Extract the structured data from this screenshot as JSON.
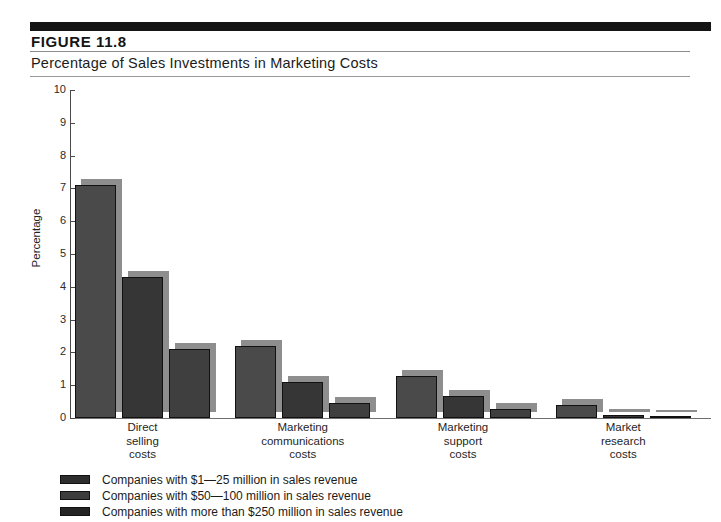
{
  "figure": {
    "number_label": "FIGURE  11.8",
    "caption": "Percentage of Sales Investments in Marketing Costs"
  },
  "chart_data": {
    "type": "bar",
    "title": "Percentage of Sales Investments in Marketing Costs",
    "xlabel": "",
    "ylabel": "Percentage",
    "ylim": [
      0,
      10
    ],
    "ytick_labels": [
      "10",
      "9",
      "8",
      "7",
      "6",
      "5",
      "4",
      "3",
      "2",
      "1",
      "0"
    ],
    "yticks": [
      10,
      9,
      8,
      7,
      6,
      5,
      4,
      3,
      2,
      1,
      0
    ],
    "grid": false,
    "legend_position": "below-plot-left",
    "categories": [
      "Direct selling costs",
      "Marketing communications costs",
      "Marketing support costs",
      "Market research costs"
    ],
    "category_label_lines": [
      [
        "Direct",
        "selling",
        "costs"
      ],
      [
        "Marketing",
        "communications",
        "costs"
      ],
      [
        "Marketing",
        "support",
        "costs"
      ],
      [
        "Market",
        "research",
        "costs"
      ]
    ],
    "series": [
      {
        "name": "Companies with $1—25 million in sales revenue",
        "values": [
          7.1,
          2.2,
          1.27,
          0.4
        ],
        "color": "#4a4a4a"
      },
      {
        "name": "Companies with $50—100 million in sales revenue",
        "values": [
          4.3,
          1.1,
          0.67,
          0.1
        ],
        "color": "#363636"
      },
      {
        "name": "Companies with more than $250 million in sales revenue",
        "values": [
          2.1,
          0.45,
          0.28,
          0.05
        ],
        "color": "#3f3f3f"
      }
    ]
  },
  "legend": {
    "entries": [
      "Companies with $1—25 million in sales revenue",
      "Companies with $50—100 million in sales revenue",
      "Companies with more than $250 million in sales revenue"
    ]
  },
  "colors": {
    "band": "#141414",
    "bar_face": "#3b3b3b",
    "bar_shadow": "#8e8e8e",
    "rule": "#8d8d8d",
    "text": "#1b1b1b"
  }
}
